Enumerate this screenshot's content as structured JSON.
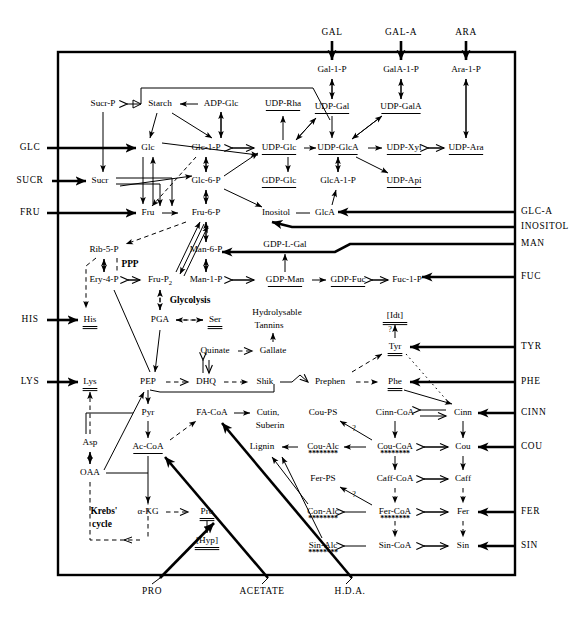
{
  "figure": {
    "type": "metabolic-pathway-diagram"
  },
  "inputs_top": [
    {
      "id": "gal",
      "label": "GAL",
      "x": 332,
      "y": 33
    },
    {
      "id": "gal_a",
      "label": "GAL-A",
      "x": 401,
      "y": 33
    },
    {
      "id": "ara",
      "label": "ARA",
      "x": 466,
      "y": 33
    }
  ],
  "inputs_left": [
    {
      "id": "glc",
      "label": "GLC",
      "x": 30,
      "y": 148
    },
    {
      "id": "sucr",
      "label": "SUCR",
      "x": 30,
      "y": 181
    },
    {
      "id": "fru",
      "label": "FRU",
      "x": 30,
      "y": 213
    },
    {
      "id": "his",
      "label": "HIS",
      "x": 30,
      "y": 320
    },
    {
      "id": "lys",
      "label": "LYS",
      "x": 30,
      "y": 382
    }
  ],
  "inputs_right": [
    {
      "id": "glc_a",
      "label": "GLC-A",
      "x": 521,
      "y": 212
    },
    {
      "id": "inositol",
      "label": "INOSITOL",
      "x": 521,
      "y": 227
    },
    {
      "id": "man",
      "label": "MAN",
      "x": 521,
      "y": 244
    },
    {
      "id": "fuc",
      "label": "FUC",
      "x": 521,
      "y": 277
    },
    {
      "id": "tyr",
      "label": "TYR",
      "x": 521,
      "y": 347
    },
    {
      "id": "phe",
      "label": "PHE",
      "x": 521,
      "y": 382
    },
    {
      "id": "cinn",
      "label": "CINN",
      "x": 521,
      "y": 413
    },
    {
      "id": "cou",
      "label": "COU",
      "x": 521,
      "y": 447
    },
    {
      "id": "fer",
      "label": "FER",
      "x": 521,
      "y": 512
    },
    {
      "id": "sin",
      "label": "SIN",
      "x": 521,
      "y": 546
    }
  ],
  "inputs_bottom": [
    {
      "id": "pro_in",
      "label": "PRO",
      "x": 152,
      "y": 592
    },
    {
      "id": "acetate_in",
      "label": "ACETATE",
      "x": 262,
      "y": 592
    },
    {
      "id": "hda_in",
      "label": "H.D.A.",
      "x": 350,
      "y": 592
    }
  ],
  "metabolites": [
    {
      "id": "sucr_p",
      "label": "Sucr-P",
      "x": 103,
      "y": 104,
      "underline": false
    },
    {
      "id": "starch",
      "label": "Starch",
      "x": 160,
      "y": 104,
      "underline": false
    },
    {
      "id": "adp_glc",
      "label": "ADP-Glc",
      "x": 221,
      "y": 104,
      "underline": false
    },
    {
      "id": "udp_rha",
      "label": "UDP-Rha",
      "x": 283,
      "y": 104,
      "underline": true
    },
    {
      "id": "gal_1_p",
      "label": "Gal-1-P",
      "x": 332,
      "y": 70,
      "underline": false
    },
    {
      "id": "gala_1_p",
      "label": "GalA-1-P",
      "x": 401,
      "y": 70,
      "underline": false
    },
    {
      "id": "ara_1_p",
      "label": "Ara-1-P",
      "x": 466,
      "y": 70,
      "underline": false
    },
    {
      "id": "udp_gal",
      "label": "UDP-Gal",
      "x": 332,
      "y": 107,
      "underline": true
    },
    {
      "id": "udp_gala",
      "label": "UDP-GalA",
      "x": 401,
      "y": 107,
      "underline": true
    },
    {
      "id": "glc",
      "label": "Glc",
      "x": 148,
      "y": 148,
      "underline": false
    },
    {
      "id": "glc_1_p",
      "label": "Glc-1-P",
      "x": 206,
      "y": 148,
      "underline": false
    },
    {
      "id": "udp_glc",
      "label": "UDP-Glc",
      "x": 279,
      "y": 148,
      "underline": true
    },
    {
      "id": "udp_glca",
      "label": "UDP-GlcA",
      "x": 338,
      "y": 148,
      "underline": true
    },
    {
      "id": "udp_xyl",
      "label": "UDP-Xyl",
      "x": 404,
      "y": 148,
      "underline": true
    },
    {
      "id": "udp_ara",
      "label": "UDP-Ara",
      "x": 466,
      "y": 148,
      "underline": true
    },
    {
      "id": "sucr",
      "label": "Sucr",
      "x": 100,
      "y": 181,
      "underline": false
    },
    {
      "id": "glc_6_p",
      "label": "Glc-6-P",
      "x": 206,
      "y": 181,
      "underline": false
    },
    {
      "id": "gdp_glc",
      "label": "GDP-Glc",
      "x": 279,
      "y": 181,
      "underline": true
    },
    {
      "id": "glca_1_p",
      "label": "GlcA-1-P",
      "x": 338,
      "y": 181,
      "underline": false
    },
    {
      "id": "udp_api",
      "label": "UDP-Api",
      "x": 404,
      "y": 181,
      "underline": true
    },
    {
      "id": "fru",
      "label": "Fru",
      "x": 148,
      "y": 213,
      "underline": false
    },
    {
      "id": "fru_6_p",
      "label": "Fru-6-P",
      "x": 206,
      "y": 213,
      "underline": false
    },
    {
      "id": "inositol",
      "label": "Inositol",
      "x": 276,
      "y": 213,
      "underline": false
    },
    {
      "id": "glca",
      "label": "GlcA",
      "x": 325,
      "y": 213,
      "underline": false
    },
    {
      "id": "rib_5_p",
      "label": "Rib-5-P",
      "x": 104,
      "y": 250,
      "underline": false
    },
    {
      "id": "man_6_p",
      "label": "Man-6-P",
      "x": 206,
      "y": 250,
      "underline": false
    },
    {
      "id": "gdp_l_gal",
      "label": "GDP-L-Gal",
      "x": 285,
      "y": 245,
      "underline": true
    },
    {
      "id": "ery_4_p",
      "label": "Ery-4-P",
      "x": 104,
      "y": 280,
      "underline": false
    },
    {
      "id": "fru_p2",
      "label": "Fru-P",
      "sub": "2",
      "x": 160,
      "y": 280,
      "underline": false
    },
    {
      "id": "man_1_p",
      "label": "Man-1-P",
      "x": 206,
      "y": 280,
      "underline": false
    },
    {
      "id": "gdp_man",
      "label": "GDP-Man",
      "x": 285,
      "y": 280,
      "underline": true
    },
    {
      "id": "gdp_fuc",
      "label": "GDP-Fuc",
      "x": 348,
      "y": 280,
      "underline": true
    },
    {
      "id": "fuc_1_p",
      "label": "Fuc-1-P",
      "x": 407,
      "y": 280,
      "underline": false
    },
    {
      "id": "his",
      "label": "His",
      "x": 90,
      "y": 320,
      "underline": true
    },
    {
      "id": "pga",
      "label": "PGA",
      "x": 160,
      "y": 320,
      "underline": false
    },
    {
      "id": "ser",
      "label": "Ser",
      "x": 215,
      "y": 320,
      "underline": true
    },
    {
      "id": "idt",
      "label": "[Idt]",
      "x": 395,
      "y": 316,
      "underline": true
    },
    {
      "id": "quinate",
      "label": "Quinate",
      "x": 215,
      "y": 351,
      "underline": false
    },
    {
      "id": "gallate",
      "label": "Gallate",
      "x": 273,
      "y": 351,
      "underline": false
    },
    {
      "id": "tyr",
      "label": "Tyr",
      "x": 395,
      "y": 347,
      "underline": true
    },
    {
      "id": "lys",
      "label": "Lys",
      "x": 90,
      "y": 382,
      "underline": true
    },
    {
      "id": "pep",
      "label": "PEP",
      "x": 148,
      "y": 382,
      "underline": false
    },
    {
      "id": "dhq",
      "label": "DHQ",
      "x": 206,
      "y": 382,
      "underline": false
    },
    {
      "id": "shik",
      "label": "Shik",
      "x": 265,
      "y": 382,
      "underline": false
    },
    {
      "id": "prephen",
      "label": "Prephen",
      "x": 330,
      "y": 382,
      "underline": false
    },
    {
      "id": "phe",
      "label": "Phe",
      "x": 395,
      "y": 382,
      "underline": true
    },
    {
      "id": "pyr",
      "label": "Pyr",
      "x": 148,
      "y": 413,
      "underline": false
    },
    {
      "id": "fa_coa",
      "label": "FA-CoA",
      "x": 212,
      "y": 413,
      "underline": false
    },
    {
      "id": "cou_ps",
      "label": "Cou-PS",
      "x": 323,
      "y": 413,
      "underline": false
    },
    {
      "id": "cinn_coa",
      "label": "Cinn-CoA",
      "x": 395,
      "y": 413,
      "underline": false
    },
    {
      "id": "cinn",
      "label": "Cinn",
      "x": 463,
      "y": 413,
      "underline": false
    },
    {
      "id": "cutin",
      "label": "Cutin,",
      "x": 268,
      "y": 413,
      "underline": false
    },
    {
      "id": "suberin",
      "label": "Suberin",
      "x": 270,
      "y": 426,
      "underline": false
    },
    {
      "id": "asp",
      "label": "Asp",
      "x": 90,
      "y": 443,
      "underline": false
    },
    {
      "id": "ac_coa",
      "label": "Ac-CoA",
      "x": 148,
      "y": 447,
      "underline": true
    },
    {
      "id": "lignin",
      "label": "Lignin",
      "x": 262,
      "y": 447,
      "underline": false
    },
    {
      "id": "cou_alc",
      "label": "Cou-Alc",
      "x": 323,
      "y": 447,
      "underline": false,
      "asterisks": true
    },
    {
      "id": "cou_coa",
      "label": "Cou-CoA",
      "x": 395,
      "y": 447,
      "underline": false,
      "asterisks": true
    },
    {
      "id": "cou",
      "label": "Cou",
      "x": 463,
      "y": 447,
      "underline": false
    },
    {
      "id": "oaa",
      "label": "OAA",
      "x": 90,
      "y": 473,
      "underline": false
    },
    {
      "id": "fer_ps",
      "label": "Fer-PS",
      "x": 323,
      "y": 479,
      "underline": false
    },
    {
      "id": "caff_coa",
      "label": "Caff-CoA",
      "x": 395,
      "y": 479,
      "underline": false
    },
    {
      "id": "caff",
      "label": "Caff",
      "x": 463,
      "y": 479,
      "underline": false
    },
    {
      "id": "akg",
      "label": "α-KG",
      "x": 148,
      "y": 512,
      "underline": false
    },
    {
      "id": "pro",
      "label": "Pro",
      "x": 207,
      "y": 512,
      "underline": true
    },
    {
      "id": "con_alc",
      "label": "Con-Alc",
      "x": 323,
      "y": 512,
      "underline": false,
      "asterisks": true
    },
    {
      "id": "fer_coa",
      "label": "Fer-CoA",
      "x": 395,
      "y": 512,
      "underline": false,
      "asterisks": true
    },
    {
      "id": "fer",
      "label": "Fer",
      "x": 463,
      "y": 512,
      "underline": false
    },
    {
      "id": "sin_alc",
      "label": "Sin-Alc",
      "x": 323,
      "y": 546,
      "underline": false,
      "asterisks": true
    },
    {
      "id": "sin_coa",
      "label": "Sin-CoA",
      "x": 395,
      "y": 546,
      "underline": false
    },
    {
      "id": "sin",
      "label": "Sin",
      "x": 463,
      "y": 546,
      "underline": false
    },
    {
      "id": "hyp",
      "label": "[Hyp]",
      "x": 207,
      "y": 541,
      "underline": true
    }
  ],
  "pathway_labels": [
    {
      "id": "ppp",
      "label": "PPP",
      "x": 130,
      "y": 265
    },
    {
      "id": "glycolysis",
      "label": "Glycolysis",
      "x": 190,
      "y": 301
    },
    {
      "id": "krebs1",
      "label": "Krebs'",
      "x": 104,
      "y": 512
    },
    {
      "id": "krebs2",
      "label": "cycle",
      "x": 102,
      "y": 525
    },
    {
      "id": "tannins1",
      "label": "Hydrolysable",
      "x": 277,
      "y": 313,
      "bold": false
    },
    {
      "id": "tannins2",
      "label": "Tannins",
      "x": 269,
      "y": 326,
      "bold": false
    }
  ],
  "query_marks": [
    {
      "id": "q_tyr",
      "x": 390,
      "y": 332
    },
    {
      "id": "q_cou_ps",
      "x": 354,
      "y": 431
    },
    {
      "id": "q_fer_ps",
      "x": 354,
      "y": 497
    }
  ],
  "frame": {
    "x": 58,
    "y": 52,
    "width": 457,
    "height": 523
  },
  "colors": {
    "stroke": "#000000",
    "background": "#ffffff"
  }
}
